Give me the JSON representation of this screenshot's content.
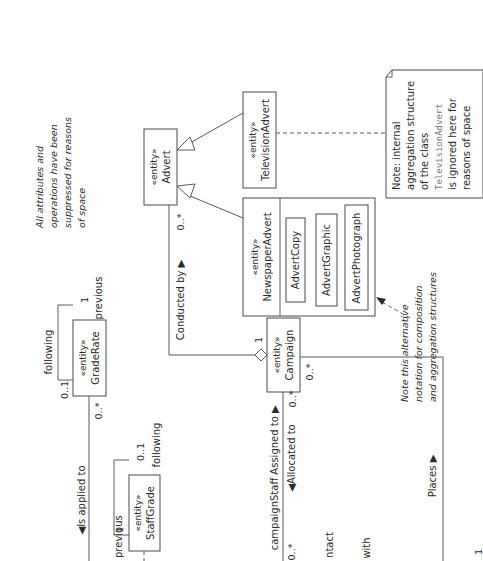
{
  "diagram": {
    "orientation": "rotated-90-ccw",
    "stereotype": "«entity»",
    "classes": {
      "advert": {
        "name": "Advert"
      },
      "television_advert": {
        "name": "TelevisionAdvert"
      },
      "newspaper_advert": {
        "name": "NewspaperAdvert",
        "parts": [
          "AdvertCopy",
          "AdvertGraphic",
          "AdvertPhotograph"
        ]
      },
      "campaign": {
        "name": "Campaign"
      },
      "grade_rate": {
        "name": "GradeRate"
      },
      "staff_grade": {
        "name": "StaffGrade"
      }
    },
    "notes": {
      "suppressed": [
        "All attributes and",
        "operations have been",
        "suppressed for reasons",
        "of space"
      ],
      "alternative_notation": [
        "Note this alternative",
        "notation for composition",
        "and aggregation structures"
      ],
      "television_note": {
        "lines_before": [
          "Note: internal",
          "aggregation structure",
          "of the class"
        ],
        "code": "TelevisionAdvert",
        "lines_after": [
          "is ignored here for",
          "reasons of space"
        ]
      }
    },
    "associations": {
      "conducted_by": {
        "label": "Conducted by ▶",
        "mult_advert": "0..*",
        "mult_campaign": "1"
      },
      "grade_rate_self": {
        "following": "following",
        "previous": "previous",
        "mult_following": "0..1",
        "mult_previous": "1"
      },
      "is_applied_to": {
        "label": "◀Is applied to",
        "mult": "0..*"
      },
      "staff_grade_self": {
        "following": "following",
        "previous": "previous",
        "mult_following": "0..1",
        "mult_previous": "1"
      },
      "assigned_to": {
        "role": "campaignStaff",
        "label": "Assigned to ▶",
        "mult_left": "0..*",
        "mult_right": "0..*"
      },
      "allocated_to": {
        "label": "◀Allocated to"
      },
      "places": {
        "label": "Places ▶",
        "mult_campaign": "0..*",
        "mult_other": "1"
      },
      "clipped": {
        "contact": "ntact",
        "with": "with"
      }
    }
  }
}
